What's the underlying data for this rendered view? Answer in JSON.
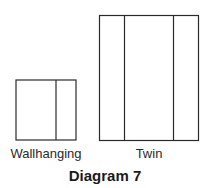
{
  "diagram": {
    "title": "Diagram 7",
    "panels": [
      {
        "name": "wallhanging",
        "label": "Wallhanging",
        "sections": 2
      },
      {
        "name": "twin",
        "label": "Twin",
        "sections": 3
      }
    ]
  },
  "colors": {
    "stroke": "#2a2a2a",
    "background": "#ffffff"
  }
}
